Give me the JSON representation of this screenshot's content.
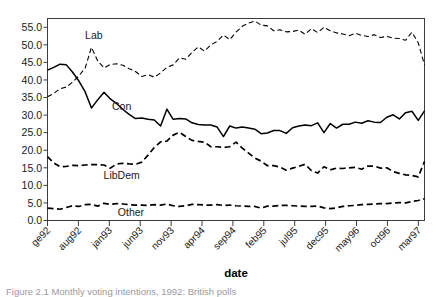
{
  "figure": {
    "caption": "Figure 2.1  Monthly voting intentions, 1992: British polls"
  },
  "chart_data": {
    "type": "line",
    "title": "",
    "xlabel": "date",
    "ylabel": "",
    "ylim": [
      0.0,
      57.5
    ],
    "xlim": [
      0,
      61
    ],
    "grid": false,
    "legend_position": "inline-labels",
    "ytick_labels": [
      "0.0",
      "5.0",
      "10.0",
      "15.0",
      "20.0",
      "25.0",
      "30.0",
      "35.0",
      "40.0",
      "45.0",
      "50.0",
      "55.0"
    ],
    "ytick_values": [
      0,
      5,
      10,
      15,
      20,
      25,
      30,
      35,
      40,
      45,
      50,
      55
    ],
    "xtick_labels": [
      "ge92",
      "aug92",
      "jan93",
      "jun93",
      "nov93",
      "apr94",
      "sep94",
      "feb95",
      "jul95",
      "dec95",
      "may96",
      "oct96",
      "mar97"
    ],
    "xtick_values": [
      0,
      5,
      10,
      15,
      20,
      25,
      30,
      35,
      40,
      45,
      50,
      55,
      60
    ],
    "series": [
      {
        "name": "Con",
        "style": "solid",
        "color": "#000000",
        "label_x": 12.0,
        "label_y": 31.5,
        "values": [
          42.8,
          43.6,
          44.5,
          44.3,
          42.2,
          39.7,
          36.6,
          32.0,
          34.4,
          36.5,
          34.6,
          33.3,
          31.6,
          30.2,
          29.0,
          29.2,
          28.8,
          28.6,
          26.9,
          31.7,
          28.8,
          29.0,
          28.9,
          27.8,
          27.3,
          27.2,
          27.2,
          26.6,
          23.9,
          26.9,
          26.3,
          26.6,
          26.3,
          26.0,
          24.7,
          24.9,
          25.6,
          25.6,
          24.8,
          26.4,
          26.9,
          27.2,
          27.0,
          27.8,
          25.0,
          27.6,
          26.3,
          27.4,
          27.4,
          28.0,
          27.7,
          28.4,
          28.0,
          27.9,
          29.4,
          30.1,
          28.9,
          30.7,
          31.1,
          28.5,
          31.2
        ]
      },
      {
        "name": "Lab",
        "style": "dashed",
        "color": "#000000",
        "label_x": 7.5,
        "label_y": 51.8,
        "values": [
          35.2,
          36.2,
          37.5,
          38.0,
          39.4,
          41.2,
          43.4,
          49.3,
          45.4,
          43.4,
          44.4,
          44.6,
          44.2,
          43.2,
          42.4,
          41.0,
          41.5,
          40.8,
          42.0,
          43.6,
          44.3,
          46.3,
          45.9,
          47.9,
          49.4,
          48.2,
          50.0,
          51.0,
          52.8,
          51.5,
          53.6,
          55.3,
          56.2,
          56.8,
          55.6,
          55.4,
          54.0,
          54.3,
          53.7,
          53.8,
          54.2,
          53.0,
          54.6,
          53.5,
          55.0,
          54.0,
          53.4,
          53.1,
          52.6,
          53.3,
          52.7,
          52.4,
          52.9,
          52.1,
          52.4,
          51.9,
          51.8,
          51.3,
          53.6,
          50.6,
          44.3
        ]
      },
      {
        "name": "LibDem",
        "style": "dashed-heavy",
        "color": "#000000",
        "label_x": 12.0,
        "label_y": 11.9,
        "values": [
          18.2,
          16.4,
          15.3,
          15.4,
          15.7,
          15.6,
          15.8,
          15.9,
          15.9,
          15.8,
          14.9,
          16.1,
          16.3,
          16.1,
          16.0,
          16.6,
          18.6,
          20.8,
          22.4,
          22.6,
          24.3,
          25.1,
          23.9,
          22.8,
          22.5,
          22.3,
          21.0,
          21.0,
          20.8,
          21.0,
          22.3,
          20.6,
          19.2,
          17.8,
          16.9,
          15.6,
          15.6,
          15.2,
          14.3,
          14.9,
          15.4,
          16.0,
          14.2,
          13.5,
          15.3,
          14.4,
          14.9,
          14.8,
          15.0,
          15.1,
          14.6,
          15.5,
          15.5,
          14.9,
          15.0,
          13.9,
          13.4,
          13.0,
          12.8,
          12.4,
          16.8
        ]
      },
      {
        "name": "Other",
        "style": "dashed-heavy",
        "color": "#000000",
        "label_x": 13.5,
        "label_y": 1.3,
        "values": [
          3.5,
          3.4,
          3.2,
          3.7,
          4.2,
          4.0,
          4.5,
          4.6,
          4.1,
          4.9,
          4.6,
          4.8,
          4.7,
          4.5,
          4.4,
          4.4,
          4.3,
          4.5,
          4.4,
          4.7,
          4.2,
          4.0,
          4.2,
          4.6,
          4.5,
          4.4,
          4.4,
          4.5,
          4.3,
          4.4,
          4.2,
          4.1,
          4.0,
          4.0,
          3.5,
          4.1,
          4.1,
          4.3,
          4.3,
          4.2,
          4.1,
          4.0,
          4.0,
          4.1,
          3.6,
          3.4,
          3.6,
          4.0,
          4.2,
          4.3,
          4.5,
          4.6,
          4.7,
          4.8,
          4.8,
          5.0,
          5.1,
          5.0,
          5.4,
          5.7,
          6.2
        ]
      }
    ]
  }
}
